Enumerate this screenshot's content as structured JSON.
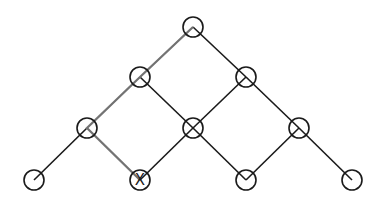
{
  "diagram": {
    "type": "lattice-tree",
    "node_radius": 10,
    "stroke_color": "#1a1a1a",
    "path_color": "#808080",
    "nodes": [
      {
        "id": "n0",
        "x": 193,
        "y": 27,
        "label": ""
      },
      {
        "id": "n1",
        "x": 140,
        "y": 77,
        "label": ""
      },
      {
        "id": "n2",
        "x": 246,
        "y": 77,
        "label": ""
      },
      {
        "id": "n3",
        "x": 87,
        "y": 128,
        "label": ""
      },
      {
        "id": "n4",
        "x": 193,
        "y": 128,
        "label": ""
      },
      {
        "id": "n5",
        "x": 299,
        "y": 128,
        "label": ""
      },
      {
        "id": "n6",
        "x": 34,
        "y": 180,
        "label": ""
      },
      {
        "id": "n7",
        "x": 140,
        "y": 180,
        "label": "X"
      },
      {
        "id": "n8",
        "x": 246,
        "y": 180,
        "label": ""
      },
      {
        "id": "n9",
        "x": 352,
        "y": 180,
        "label": ""
      }
    ],
    "edges": [
      [
        "n0",
        "n1"
      ],
      [
        "n0",
        "n2"
      ],
      [
        "n1",
        "n3"
      ],
      [
        "n1",
        "n4"
      ],
      [
        "n2",
        "n4"
      ],
      [
        "n2",
        "n5"
      ],
      [
        "n3",
        "n6"
      ],
      [
        "n3",
        "n7"
      ],
      [
        "n4",
        "n7"
      ],
      [
        "n4",
        "n8"
      ],
      [
        "n5",
        "n8"
      ],
      [
        "n5",
        "n9"
      ]
    ],
    "highlighted_path": [
      "n0",
      "n1",
      "n3",
      "n7"
    ]
  }
}
